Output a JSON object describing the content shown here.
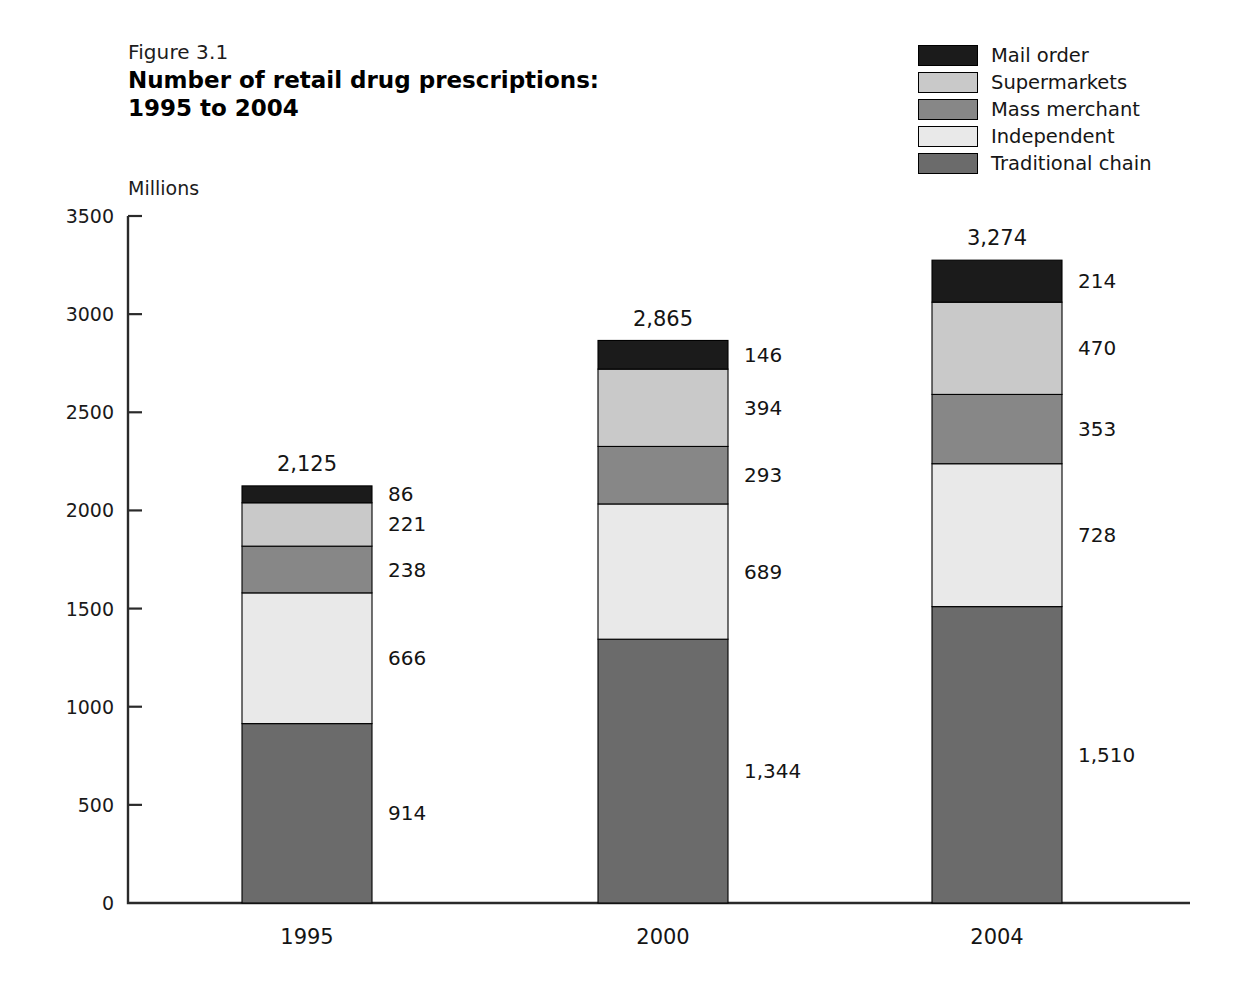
{
  "figure": {
    "number": "Figure 3.1",
    "title_line1": "Number of retail drug prescriptions:",
    "title_line2": "1995 to 2004"
  },
  "legend": {
    "items": [
      {
        "label": "Mail order",
        "color": "#1b1b1b"
      },
      {
        "label": "Supermarkets",
        "color": "#c9c9c9"
      },
      {
        "label": "Mass merchant",
        "color": "#878787"
      },
      {
        "label": "Independent",
        "color": "#e9e9e9"
      },
      {
        "label": "Traditional chain",
        "color": "#6b6b6b"
      }
    ]
  },
  "chart_data": {
    "type": "bar",
    "subtype": "stacked-vertical",
    "title": "Number of retail drug prescriptions: 1995 to 2004",
    "xlabel": "",
    "ylabel": "Millions",
    "ylim": [
      0,
      3500
    ],
    "ytick_step": 500,
    "yticks": [
      "0",
      "500",
      "1000",
      "1500",
      "2000",
      "2500",
      "3000",
      "3500"
    ],
    "grid": false,
    "legend_position": "top-right",
    "categories": [
      "1995",
      "2000",
      "2004"
    ],
    "stack_order_bottom_to_top": [
      "Traditional chain",
      "Independent",
      "Mass merchant",
      "Supermarkets",
      "Mail order"
    ],
    "series": [
      {
        "name": "Traditional chain",
        "color": "#6b6b6b",
        "values": [
          914,
          1344,
          1510
        ],
        "labels": [
          "914",
          "1,344",
          "1,510"
        ]
      },
      {
        "name": "Independent",
        "color": "#e9e9e9",
        "values": [
          666,
          689,
          728
        ],
        "labels": [
          "666",
          "689",
          "728"
        ]
      },
      {
        "name": "Mass merchant",
        "color": "#878787",
        "values": [
          238,
          293,
          353
        ],
        "labels": [
          "238",
          "293",
          "353"
        ]
      },
      {
        "name": "Supermarkets",
        "color": "#c9c9c9",
        "values": [
          221,
          394,
          470
        ],
        "labels": [
          "221",
          "394",
          "470"
        ]
      },
      {
        "name": "Mail order",
        "color": "#1b1b1b",
        "values": [
          86,
          146,
          214
        ],
        "labels": [
          "86",
          "146",
          "214"
        ]
      }
    ],
    "totals": [
      2125,
      2865,
      3274
    ],
    "total_labels": [
      "2,125",
      "2,865",
      "3,274"
    ]
  },
  "geometry": {
    "plot_left": 128,
    "plot_right": 1190,
    "plot_top": 216,
    "plot_bottom": 903,
    "bar_width": 130,
    "bar_centers": [
      307,
      663,
      997
    ],
    "label_gap": 16,
    "tick_length": 14
  }
}
